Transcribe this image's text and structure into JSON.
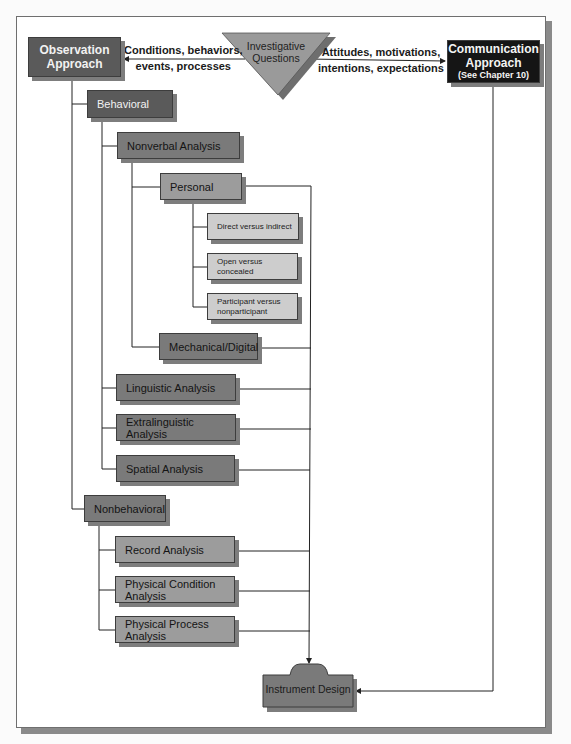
{
  "diagram": {
    "type": "hierarchical flowchart",
    "center": {
      "label_line1": "Investigative",
      "label_line2": "Questions",
      "shape": "inverted-triangle"
    },
    "left_edge": {
      "line1": "Conditions, behaviors,",
      "line2": "events, processes"
    },
    "right_edge": {
      "line1": "Attitudes, motivations,",
      "line2": "intentions, expectations"
    },
    "observation": {
      "line1": "Observation",
      "line2": "Approach"
    },
    "communication": {
      "line1": "Communication",
      "line2": "Approach",
      "line3": "(See Chapter 10)"
    },
    "behavioral": {
      "label": "Behavioral",
      "nonverbal": {
        "label": "Nonverbal Analysis",
        "personal": {
          "label": "Personal",
          "children": [
            {
              "label": "Direct versus indirect"
            },
            {
              "label": "Open versus concealed"
            },
            {
              "label_line1": "Participant versus",
              "label_line2": "nonparticipant"
            }
          ]
        },
        "mechanical": {
          "label": "Mechanical/Digital"
        }
      },
      "linguistic": {
        "label": "Linguistic Analysis"
      },
      "extralinguistic": {
        "label": "Extralinguistic Analysis"
      },
      "spatial": {
        "label": "Spatial Analysis"
      }
    },
    "nonbehavioral": {
      "label": "Nonbehavioral",
      "record": {
        "label": "Record Analysis"
      },
      "physical_condition": {
        "line1": "Physical Condition",
        "line2": "Analysis"
      },
      "physical_process": {
        "line1": "Physical Process",
        "line2": "Analysis"
      }
    },
    "instrument": {
      "label": "Instrument Design"
    },
    "colors": {
      "dark_box": "#5a5a5a",
      "mid_box": "#7a7a7a",
      "light_box": "#9c9c9c",
      "pale_box": "#cdcdcd",
      "black_box": "#151515",
      "triangle": "#9a9a9a"
    }
  }
}
